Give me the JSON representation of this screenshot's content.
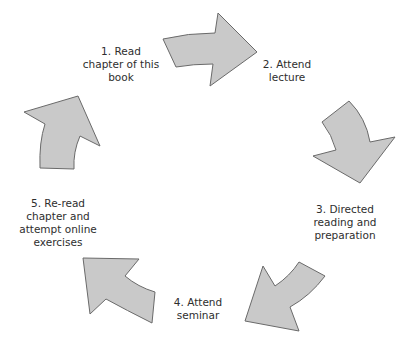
{
  "diagram": {
    "type": "cycle",
    "colors": {
      "arrow_fill": "#c9c9c9",
      "arrow_stroke": "#6a6a6a",
      "text": "#2e2e2e",
      "background": "#ffffff"
    },
    "steps": [
      {
        "number": 1,
        "lines": [
          "1. Read",
          "chapter of this",
          "book"
        ]
      },
      {
        "number": 2,
        "lines": [
          "2. Attend",
          "lecture"
        ]
      },
      {
        "number": 3,
        "lines": [
          "3. Directed",
          "reading and",
          "preparation"
        ]
      },
      {
        "number": 4,
        "lines": [
          "4. Attend",
          "seminar"
        ]
      },
      {
        "number": 5,
        "lines": [
          "5. Re-read",
          "chapter and",
          "attempt online",
          "exercises"
        ]
      }
    ],
    "arrows": [
      {
        "from": 1,
        "to": 2,
        "direction": "right"
      },
      {
        "from": 2,
        "to": 3,
        "direction": "down"
      },
      {
        "from": 3,
        "to": 4,
        "direction": "down-left"
      },
      {
        "from": 4,
        "to": 5,
        "direction": "up-left"
      },
      {
        "from": 5,
        "to": 1,
        "direction": "up-right"
      }
    ]
  }
}
